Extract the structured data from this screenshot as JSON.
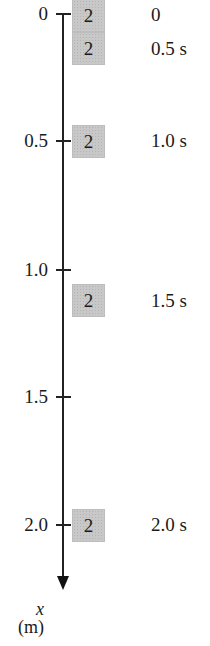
{
  "axis": {
    "variable": "x",
    "unit": "(m)",
    "ticks": [
      {
        "label": "0",
        "value": 0
      },
      {
        "label": "0.5",
        "value": 0.5
      },
      {
        "label": "1.0",
        "value": 1.0
      },
      {
        "label": "1.5",
        "value": 1.5
      },
      {
        "label": "2.0",
        "value": 2.0
      }
    ]
  },
  "object_label": "2",
  "snapshots": [
    {
      "time_label": "0",
      "time": 0,
      "position": 0
    },
    {
      "time_label": "0.5 s",
      "time": 0.5,
      "position": 0.125
    },
    {
      "time_label": "1.0 s",
      "time": 1.0,
      "position": 0.5
    },
    {
      "time_label": "1.5 s",
      "time": 1.5,
      "position": 1.125
    },
    {
      "time_label": "2.0 s",
      "time": 2.0,
      "position": 2.0
    }
  ],
  "colors": {
    "box_fill": "#c8c8c8",
    "axis": "#222222"
  }
}
